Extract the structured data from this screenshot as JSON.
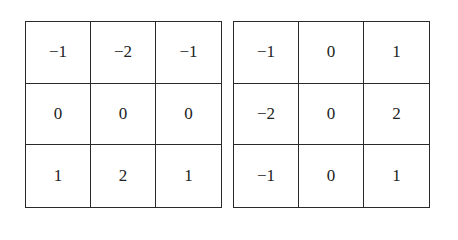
{
  "kernels": [
    {
      "name": "sobel-vertical-gradient",
      "rows": [
        [
          "−1",
          "−2",
          "−1"
        ],
        [
          "0",
          "0",
          "0"
        ],
        [
          "1",
          "2",
          "1"
        ]
      ]
    },
    {
      "name": "sobel-horizontal-gradient",
      "rows": [
        [
          "−1",
          "0",
          "1"
        ],
        [
          "−2",
          "0",
          "2"
        ],
        [
          "−1",
          "0",
          "1"
        ]
      ]
    }
  ]
}
